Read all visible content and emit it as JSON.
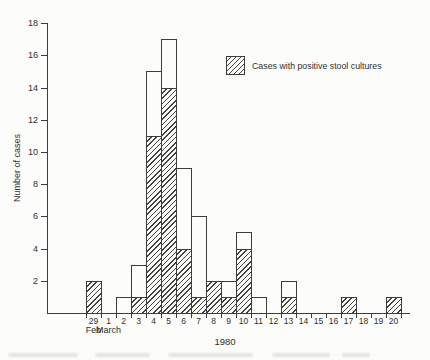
{
  "figure": {
    "background": "#fcfcfa",
    "ink_color": "#3d3d3d"
  },
  "chart_data": {
    "type": "bar",
    "subtype": "epidemic-curve-histogram",
    "title": "",
    "ylabel": "Number of cases",
    "xlabel": "1980",
    "ylim": [
      0,
      18
    ],
    "y_ticks": [
      2,
      4,
      6,
      8,
      10,
      12,
      14,
      16,
      18
    ],
    "categories": [
      "29",
      "1",
      "2",
      "3",
      "4",
      "5",
      "6",
      "7",
      "8",
      "9",
      "10",
      "11",
      "12",
      "13",
      "14",
      "15",
      "16",
      "17",
      "18",
      "19",
      "20"
    ],
    "month_labels": [
      {
        "label": "Feb",
        "index": 0
      },
      {
        "label": "March",
        "index": 1
      }
    ],
    "series": [
      {
        "name": "All cases",
        "style": "open-outline",
        "values": [
          2,
          0,
          1,
          3,
          15,
          17,
          9,
          6,
          2,
          2,
          5,
          1,
          0,
          2,
          0,
          0,
          0,
          1,
          0,
          0,
          1
        ]
      },
      {
        "name": "Cases with positive stool cultures",
        "style": "hatched",
        "values": [
          2,
          0,
          0,
          1,
          11,
          14,
          4,
          1,
          2,
          1,
          4,
          0,
          0,
          1,
          0,
          0,
          0,
          1,
          0,
          0,
          1
        ]
      }
    ],
    "legend": {
      "position": "upper-right",
      "entries": [
        "Cases with positive stool cultures"
      ]
    },
    "grid": false
  }
}
